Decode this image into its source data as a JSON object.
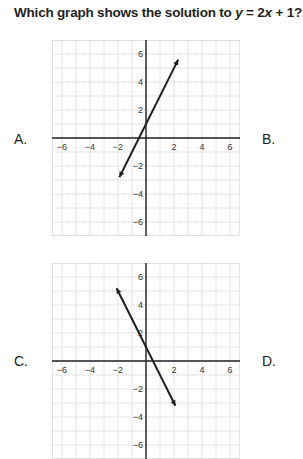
{
  "question": {
    "prefix": "Which graph shows the solution to ",
    "var_y": "y",
    "eq": " = 2",
    "var_x": "x",
    "suffix": " + 1?"
  },
  "options": [
    {
      "letter": "A.",
      "graph_index": 0
    },
    {
      "letter": "B.",
      "graph_index": null
    },
    {
      "letter": "C.",
      "graph_index": 1
    },
    {
      "letter": "D.",
      "graph_index": null
    }
  ],
  "graphs": [
    {
      "line": {
        "from": [
          -1.9,
          -2.8
        ],
        "to": [
          2.3,
          5.6
        ]
      },
      "x_ticks": [
        "−6",
        "−4",
        "−2",
        "2",
        "4",
        "6"
      ],
      "y_ticks": [
        "6",
        "4",
        "2",
        "−2",
        "−4",
        "−6"
      ]
    },
    {
      "line": {
        "from": [
          -2.1,
          5.2
        ],
        "to": [
          2.1,
          -3.2
        ]
      },
      "x_ticks": [
        "−6",
        "−4",
        "−2",
        "2",
        "4",
        "6"
      ],
      "y_ticks": [
        "6",
        "4",
        "2",
        "−2",
        "−4",
        "−6"
      ]
    }
  ],
  "colors": {
    "grid": "#c8c8c8",
    "axis": "#231f20",
    "line": "#231f20",
    "text": "#231f20"
  }
}
